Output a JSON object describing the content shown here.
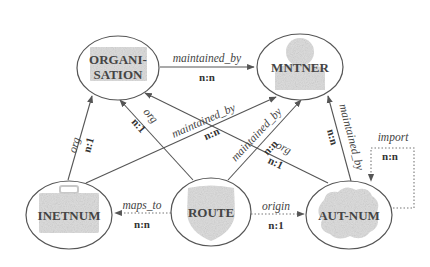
{
  "diagram": {
    "nodes": [
      {
        "id": "organisation",
        "label_line1": "ORGANI-",
        "label_line2": "SATION",
        "icon": "building-icon"
      },
      {
        "id": "mntner",
        "label": "MNTNER",
        "icon": "person-icon"
      },
      {
        "id": "inetnum",
        "label": "INETNUM",
        "icon": "briefcase-icon"
      },
      {
        "id": "route",
        "label": "ROUTE",
        "icon": "shield-icon"
      },
      {
        "id": "autnum",
        "label": "AUT-NUM",
        "icon": "cloud-icon"
      }
    ],
    "edges": [
      {
        "id": "org-mntner",
        "from": "organisation",
        "to": "mntner",
        "relation": "maintained_by",
        "cardinality": "n:n",
        "style": "solid"
      },
      {
        "id": "inetnum-org",
        "from": "inetnum",
        "to": "organisation",
        "relation": "org",
        "cardinality": "n:1",
        "style": "solid"
      },
      {
        "id": "route-org",
        "from": "route",
        "to": "organisation",
        "relation": "org",
        "cardinality": "n:1",
        "style": "solid"
      },
      {
        "id": "autnum-org",
        "from": "autnum",
        "to": "organisation",
        "relation": "maintained_by",
        "cardinality": "n:n",
        "style": "solid"
      },
      {
        "id": "inetnum-mntner",
        "from": "inetnum",
        "to": "mntner",
        "relation": "maintained_by",
        "cardinality": "n:n",
        "style": "solid"
      },
      {
        "id": "route-mntner",
        "from": "route",
        "to": "mntner",
        "relation": "maintained_by",
        "cardinality": "n:n",
        "style": "solid"
      },
      {
        "id": "autnum-mntner",
        "from": "autnum",
        "to": "mntner",
        "relation": "maintained_by",
        "cardinality": "n:n",
        "style": "solid"
      },
      {
        "id": "autnum-org-line",
        "from": "autnum",
        "to": "organisation",
        "relation": "org",
        "cardinality": "n:1",
        "style": "solid"
      },
      {
        "id": "route-inetnum",
        "from": "route",
        "to": "inetnum",
        "relation": "maps_to",
        "cardinality": "n:n",
        "style": "dotted"
      },
      {
        "id": "route-autnum",
        "from": "route",
        "to": "autnum",
        "relation": "origin",
        "cardinality": "n:1",
        "style": "dotted"
      },
      {
        "id": "autnum-self",
        "from": "autnum",
        "to": "autnum",
        "relation": "import",
        "cardinality": "n:n",
        "style": "dotted"
      }
    ]
  }
}
